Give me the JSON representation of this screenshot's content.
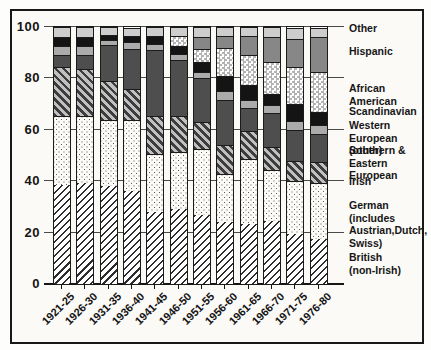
{
  "chart_data": {
    "type": "bar",
    "stacked": true,
    "title": "",
    "xlabel": "",
    "ylabel": "",
    "categories": [
      "1921-25",
      "1926-30",
      "1931-35",
      "1936-40",
      "1941-45",
      "1946-50",
      "1951-55",
      "1956-60",
      "1961-65",
      "1966-70",
      "1971-75",
      "1976-80"
    ],
    "series": [
      {
        "key": "british",
        "label": "British (non-Irish)",
        "fill": {
          "pattern": "hatch-up",
          "fg": "#2e2e2e",
          "bg": "#ffffff"
        },
        "values": [
          38.5,
          39.5,
          38,
          36,
          28,
          29,
          27,
          24,
          23.5,
          24.5,
          19.5,
          17.5
        ]
      },
      {
        "key": "german",
        "label": "German (includes Austrian, Dutch, Swiss)",
        "fill": {
          "pattern": "dots",
          "fg": "#5a5a5a",
          "bg": "#fcfbf7"
        },
        "values": [
          27,
          26,
          26,
          28,
          22.5,
          22.5,
          25.5,
          19,
          25,
          20,
          20.5,
          22
        ]
      },
      {
        "key": "irish",
        "label": "Irish",
        "fill": {
          "pattern": "hatch-down",
          "fg": "#3d3d3d",
          "bg": "#c0c0c0"
        },
        "values": [
          19,
          18,
          15,
          12,
          15,
          14,
          10.5,
          11,
          11,
          9,
          8,
          8
        ]
      },
      {
        "key": "se-european",
        "label": "Southern & Eastern European",
        "fill": {
          "pattern": "solid",
          "bg": "#4e4e4e"
        },
        "values": [
          4.5,
          5.5,
          14,
          15.5,
          25.5,
          21.5,
          17,
          17.5,
          9,
          13,
          12,
          11
        ]
      },
      {
        "key": "w-european",
        "label": "Western European (other)",
        "fill": {
          "pattern": "solid",
          "bg": "#ababab"
        },
        "values": [
          3.5,
          3.5,
          2,
          2.5,
          2.5,
          2.5,
          2.5,
          3.5,
          3,
          3,
          3.5,
          3.5
        ]
      },
      {
        "key": "scandinavian",
        "label": "Scandinavian",
        "fill": {
          "pattern": "solid",
          "bg": "#141414"
        },
        "values": [
          3.5,
          3.5,
          2,
          2.5,
          3,
          3,
          4,
          6,
          6,
          4.5,
          6.5,
          5
        ]
      },
      {
        "key": "african-american",
        "label": "African American",
        "fill": {
          "pattern": "checker",
          "fg": "#b3b3b3",
          "bg": "#ffffff"
        },
        "values": [
          0,
          0,
          0,
          0,
          0,
          4,
          5,
          11,
          11.5,
          12.5,
          14.5,
          15.5
        ]
      },
      {
        "key": "hispanic",
        "label": "Hispanic",
        "fill": {
          "pattern": "solid",
          "bg": "#878787"
        },
        "values": [
          0,
          0,
          0,
          0,
          0,
          0,
          4.5,
          4.5,
          7.5,
          9.5,
          11,
          13.5
        ]
      },
      {
        "key": "other",
        "label": "Other",
        "fill": {
          "pattern": "solid",
          "bg": "#cdcdcd"
        },
        "values": [
          4,
          4,
          3,
          3,
          3.5,
          3.5,
          4,
          3.5,
          3.5,
          4,
          4,
          3.5
        ]
      }
    ],
    "y_axis": {
      "ticks": [
        0,
        20,
        40,
        60,
        80,
        100
      ],
      "lim": [
        0,
        100
      ],
      "grid": true
    },
    "legend": {
      "position": "right",
      "entries": [
        {
          "series": "other",
          "text": "Other",
          "y": 22
        },
        {
          "series": "hispanic",
          "text": "Hispanic",
          "y": 45
        },
        {
          "series": "african-american",
          "text": "African American",
          "y": 82
        },
        {
          "series": "scandinavian",
          "text": "Scandinavian",
          "y": 105
        },
        {
          "series": "w-european",
          "text": "Western European\n(other)",
          "y": 119
        },
        {
          "series": "se-european",
          "text": "Southern &\nEastern European",
          "y": 144
        },
        {
          "series": "irish",
          "text": "Irish",
          "y": 175
        },
        {
          "series": "german",
          "text": "German (includes\nAustrian,Dutch,\nSwiss)",
          "y": 199
        },
        {
          "series": "british",
          "text": "British\n(non-Irish)",
          "y": 251
        }
      ]
    }
  },
  "colors": {
    "frame": "#181818",
    "grid": "#4a4a4a",
    "text": "#161616",
    "paper": "#fbfaf7"
  }
}
